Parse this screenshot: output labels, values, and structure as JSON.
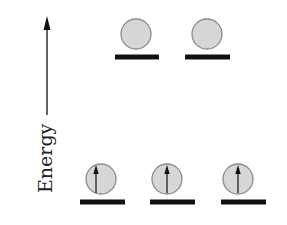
{
  "axis": {
    "label": "Energy",
    "direction": "up"
  },
  "colors": {
    "orbital_fill": "#d6d6d6",
    "orbital_stroke": "#8a8a8a",
    "bar": "#111111",
    "arrow": "#111111",
    "background": "#ffffff"
  },
  "levels": [
    {
      "name": "upper",
      "orbitals": [
        {
          "cx": 136,
          "cy": 34,
          "electrons": 0
        },
        {
          "cx": 207,
          "cy": 34,
          "electrons": 0
        }
      ],
      "bar_y": 57
    },
    {
      "name": "lower",
      "orbitals": [
        {
          "cx": 101,
          "cy": 179,
          "electrons": 1,
          "spin": "up"
        },
        {
          "cx": 167,
          "cy": 179,
          "electrons": 1,
          "spin": "up"
        },
        {
          "cx": 238,
          "cy": 179,
          "electrons": 1,
          "spin": "up"
        }
      ],
      "bar_y": 202
    }
  ]
}
